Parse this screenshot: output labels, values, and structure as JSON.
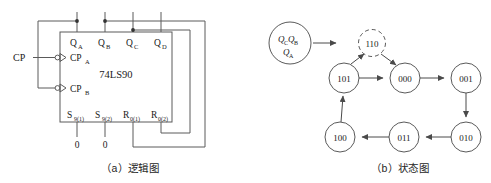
{
  "figure": {
    "panel_a": {
      "caption": "（a）逻辑图",
      "chip_label": "74LS90",
      "outputs": [
        "Q",
        "Q",
        "Q",
        "Q"
      ],
      "output_subs": [
        "A",
        "B",
        "C",
        "D"
      ],
      "clock_input_label": "CP",
      "clock_pins": [
        "CP",
        "CP"
      ],
      "clock_pin_subs": [
        "A",
        "B"
      ],
      "set_pins": [
        {
          "base": "S",
          "sub": "9(1)"
        },
        {
          "base": "S",
          "sub": "9(2)"
        }
      ],
      "reset_pins": [
        {
          "base": "R",
          "sub": "0(1)"
        },
        {
          "base": "R",
          "sub": "0(2)"
        }
      ],
      "ground_labels": [
        "0",
        "0"
      ]
    },
    "panel_b": {
      "caption": "（b）状态图",
      "legend": {
        "line1_base": "Q",
        "line1_sub1": "C",
        "line1_base2": "Q",
        "line1_sub2": "B",
        "line2_base": "Q",
        "line2_sub": "A"
      },
      "invalid_state": "110",
      "states": [
        "101",
        "000",
        "001",
        "010",
        "011",
        "100"
      ],
      "transitions": [
        {
          "from": "000",
          "to": "001"
        },
        {
          "from": "001",
          "to": "010"
        },
        {
          "from": "010",
          "to": "011"
        },
        {
          "from": "011",
          "to": "100"
        },
        {
          "from": "100",
          "to": "101"
        },
        {
          "from": "101",
          "to": "000"
        },
        {
          "from": "101",
          "to": "110"
        },
        {
          "from": "110",
          "to": "000"
        }
      ]
    },
    "colors": {
      "line": "#5a5a5a",
      "text": "#1a1a1a",
      "background": "#ffffff"
    }
  }
}
